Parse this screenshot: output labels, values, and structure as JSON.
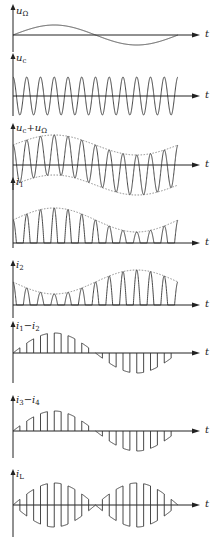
{
  "figure": {
    "colors": {
      "trace": "#333333",
      "axis": "#222222",
      "envelope": "#555555",
      "background": "#ffffff"
    },
    "x_start": 13,
    "x_end": 178,
    "arrow_end": 200,
    "carrier_cycles": 12,
    "panels": [
      {
        "id": "u_omega",
        "label_main": "u",
        "label_sub": "Ω",
        "axis_label": "t",
        "label_y": 6,
        "axis_y": 35,
        "top": 4,
        "bottom": 52,
        "type": "modulating",
        "amp": 10
      },
      {
        "id": "u_c",
        "label_main": "u",
        "label_sub": "c",
        "axis_label": "t",
        "label_y": 53,
        "axis_y": 96,
        "top": 53,
        "bottom": 116,
        "type": "carrier",
        "amp": 19
      },
      {
        "id": "u_c_plus_u_omega",
        "label_main": "u",
        "label_sub": "c",
        "label_plus": "+u",
        "label_sub2": "Ω",
        "axis_label": "t",
        "label_y": 123,
        "axis_y": 165,
        "top": 123,
        "bottom": 190,
        "type": "sum",
        "base": 20,
        "mod": 10
      },
      {
        "id": "i_1",
        "label_main": "i",
        "label_sub": "1",
        "axis_label": "t",
        "label_y": 177,
        "axis_y": 243,
        "top": 177,
        "bottom": 248,
        "type": "half_rect_pos",
        "base": 23,
        "mod": 12
      },
      {
        "id": "i_2",
        "label_main": "i",
        "label_sub": "2",
        "axis_label": "t",
        "label_y": 260,
        "axis_y": 305,
        "top": 260,
        "bottom": 318,
        "type": "half_rect_neg",
        "base": 23,
        "mod": 12
      },
      {
        "id": "i_1_minus_i_2",
        "label_main": "i",
        "label_sub": "1",
        "label_plus": "−i",
        "label_sub2": "2",
        "axis_label": "t",
        "label_y": 321,
        "axis_y": 353,
        "top": 321,
        "bottom": 383,
        "type": "chopped",
        "amp": 20
      },
      {
        "id": "i_3_minus_i_4",
        "label_main": "i",
        "label_sub": "3",
        "label_plus": "−i",
        "label_sub2": "4",
        "axis_label": "t",
        "label_y": 395,
        "axis_y": 431,
        "top": 395,
        "bottom": 458,
        "type": "chopped",
        "amp": 20
      },
      {
        "id": "i_L",
        "label_main": "i",
        "label_sub": "L",
        "axis_label": "t",
        "label_y": 469,
        "axis_y": 505,
        "top": 469,
        "bottom": 537,
        "type": "dsb_square",
        "amp": 22
      }
    ]
  }
}
